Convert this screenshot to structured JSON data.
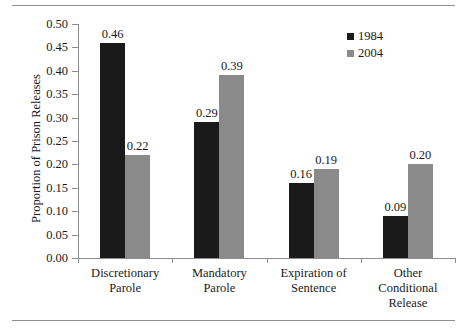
{
  "figure": {
    "has_top_rule": true,
    "has_bottom_rule": true,
    "rule_color": "#8e8e8e",
    "background": "#ffffff"
  },
  "legend": {
    "position": "top-right",
    "entries": [
      {
        "label": "1984",
        "color": "#1a1a1a",
        "swatch": "square-swatch"
      },
      {
        "label": "2004",
        "color": "#8a8a8a",
        "swatch": "square-swatch"
      }
    ]
  },
  "chart_data": {
    "type": "bar",
    "title": "",
    "xlabel": "",
    "ylabel": "Proportion of Prison Releases",
    "ylim": [
      0.0,
      0.5
    ],
    "ytick_labels": [
      "0.00",
      "0.05",
      "0.10",
      "0.15",
      "0.20",
      "0.25",
      "0.30",
      "0.35",
      "0.40",
      "0.45",
      "0.50"
    ],
    "ytick_values": [
      0.0,
      0.05,
      0.1,
      0.15,
      0.2,
      0.25,
      0.3,
      0.35,
      0.4,
      0.45,
      0.5
    ],
    "grid": false,
    "legend_position": "top-right",
    "categories": [
      "Discretionary\nParole",
      "Mandatory\nParole",
      "Expiration of\nSentence",
      "Other\nConditional\nRelease"
    ],
    "series": [
      {
        "name": "1984",
        "color": "#1a1a1a",
        "values": [
          0.46,
          0.29,
          0.16,
          0.09
        ],
        "labels": [
          "0.46",
          "0.29",
          "0.16",
          "0.09"
        ]
      },
      {
        "name": "2004",
        "color": "#8a8a8a",
        "values": [
          0.22,
          0.39,
          0.19,
          0.2
        ],
        "labels": [
          "0.22",
          "0.39",
          "0.19",
          "0.20"
        ]
      }
    ]
  }
}
